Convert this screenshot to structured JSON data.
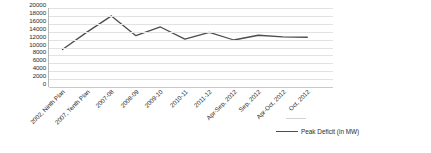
{
  "chart_data": {
    "type": "line",
    "title": "",
    "xlabel": "",
    "ylabel": "",
    "ylim": [
      0,
      20000
    ],
    "ytick_step": 2000,
    "grid": true,
    "legend_position": "bottom-right",
    "categories": [
      "2002, Ninth Plan",
      "2007, Tenth Plan",
      "2007-08",
      "2008-09",
      "2009-10",
      "2010-11",
      "2011-12",
      "Apr-Sep, 2012",
      "Sep, 2012",
      "Apr-Oct, 2012",
      "Oct, 2012"
    ],
    "ytick_labels": [
      "20000",
      "18000",
      "16000",
      "14000",
      "12000",
      "10000",
      "8000",
      "6000",
      "4000",
      "2000",
      "0"
    ],
    "series": [
      {
        "name": "Peak Deficit (in MW)",
        "color": "#4d4d4d",
        "values": [
          9500,
          13900,
          18000,
          13000,
          15200,
          12100,
          13800,
          11900,
          13100,
          12700,
          12600
        ]
      }
    ]
  },
  "legend": {
    "entries": [
      {
        "label": "Peak Deficit (in MW)",
        "color": "#4d4d4d"
      }
    ]
  }
}
